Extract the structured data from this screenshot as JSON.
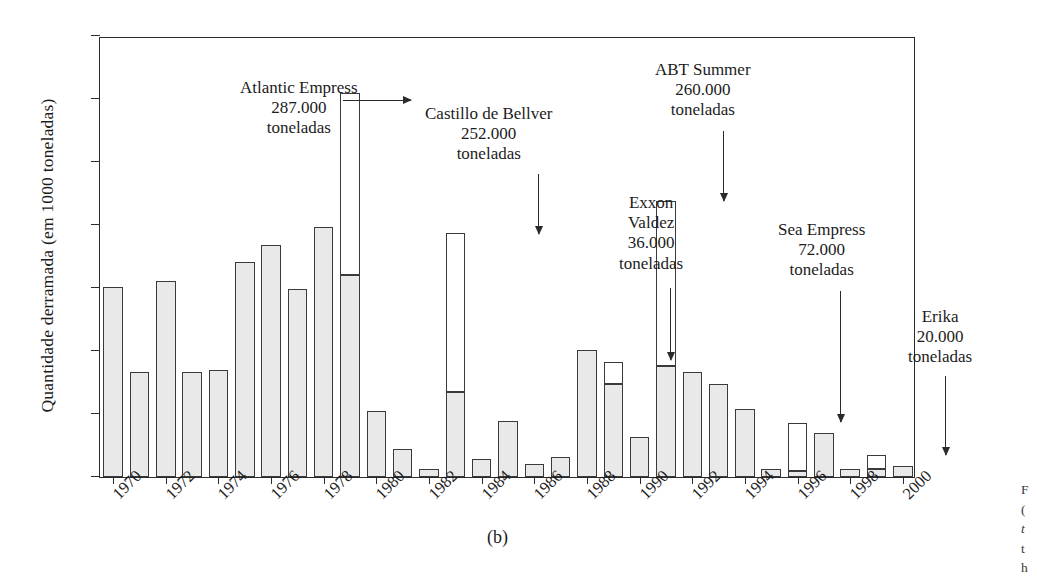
{
  "figure": {
    "panel_label": "(b)",
    "y_axis_title": "Quantidade derramada (em 1000 toneladas)",
    "side_caption_fragments": [
      "F",
      "(",
      "t",
      "t",
      "h"
    ]
  },
  "chart_data": {
    "type": "bar",
    "title": "",
    "xlabel": "",
    "ylabel": "Quantidade derramada (em 1000 toneladas)",
    "ylim": [
      0,
      700
    ],
    "yticks": [
      0,
      100,
      200,
      300,
      400,
      500,
      600,
      700
    ],
    "grid": false,
    "legend": "none",
    "stacked": true,
    "note": "Each year is one bar. The grey segment is the routine spill amount; where a named major accident occurred, a white segment is stacked on top representing that single accident's contribution. Total = grey + white.",
    "categories": [
      1970,
      1971,
      1972,
      1973,
      1974,
      1975,
      1976,
      1977,
      1978,
      1979,
      1980,
      1981,
      1982,
      1983,
      1984,
      1985,
      1986,
      1987,
      1988,
      1989,
      1990,
      1991,
      1992,
      1993,
      1994,
      1995,
      1996,
      1997,
      1998,
      1999,
      2000
    ],
    "xtick_labels": [
      "1970",
      "1972",
      "1974",
      "1976",
      "1978",
      "1980",
      "1982",
      "1984",
      "1986",
      "1988",
      "1990",
      "1992",
      "1994",
      "1996",
      "1998",
      "2000"
    ],
    "series": [
      {
        "name": "Restante (cinza)",
        "values": [
          302,
          167,
          311,
          167,
          170,
          342,
          368,
          298,
          397,
          320,
          104,
          45,
          12,
          135,
          29,
          89,
          21,
          32,
          202,
          147,
          64,
          177,
          166,
          147,
          108,
          13,
          10,
          70,
          13,
          13,
          17
        ]
      },
      {
        "name": "Acidente destacado (branco)",
        "values": [
          0,
          0,
          0,
          0,
          0,
          0,
          0,
          0,
          0,
          290,
          0,
          0,
          0,
          253,
          0,
          0,
          0,
          0,
          0,
          35,
          0,
          261,
          0,
          0,
          0,
          0,
          75,
          0,
          0,
          22,
          0
        ]
      }
    ],
    "totals": [
      302,
      167,
      311,
      167,
      170,
      342,
      368,
      298,
      397,
      610,
      104,
      45,
      12,
      388,
      29,
      89,
      21,
      32,
      202,
      182,
      64,
      438,
      166,
      147,
      108,
      13,
      85,
      70,
      13,
      35,
      17
    ],
    "annotations": [
      {
        "name": "Atlantic Empress",
        "lines": [
          "Atlantic Empress",
          "287.000",
          "toneladas"
        ],
        "year": 1979,
        "amount_label": "287.000",
        "units": "toneladas",
        "arrow": "horizontal"
      },
      {
        "name": "Castillo de Bellver",
        "lines": [
          "Castillo de Bellver",
          "252.000",
          "toneladas"
        ],
        "year": 1983,
        "amount_label": "252.000",
        "units": "toneladas",
        "arrow": "vertical"
      },
      {
        "name": "Exxon Valdez",
        "lines": [
          "Exxon",
          "Valdez",
          "36.000",
          "toneladas"
        ],
        "year": 1989,
        "amount_label": "36.000",
        "units": "toneladas",
        "arrow": "vertical"
      },
      {
        "name": "ABT Summer",
        "lines": [
          "ABT Summer",
          "260.000",
          "toneladas"
        ],
        "year": 1991,
        "amount_label": "260.000",
        "units": "toneladas",
        "arrow": "vertical"
      },
      {
        "name": "Sea Empress",
        "lines": [
          "Sea Empress",
          "72.000",
          "toneladas"
        ],
        "year": 1996,
        "amount_label": "72.000",
        "units": "toneladas",
        "arrow": "vertical"
      },
      {
        "name": "Erika",
        "lines": [
          "Erika",
          "20.000",
          "toneladas"
        ],
        "year": 1999,
        "amount_label": "20.000",
        "units": "toneladas",
        "arrow": "vertical"
      }
    ]
  },
  "colors": {
    "bar_fill_grey": "#e9e9e9",
    "bar_fill_white": "#ffffff",
    "bar_stroke": "#3a3a3a",
    "axis": "#2b2b2b",
    "text": "#1c1c1c",
    "background": "#ffffff"
  }
}
